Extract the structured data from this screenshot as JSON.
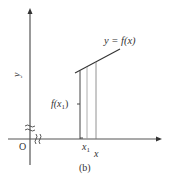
{
  "figure": {
    "caption": "(b)",
    "axes": {
      "x_label": "x",
      "y_label": "y",
      "origin_label": "O",
      "x_break_symbol": "§",
      "y_break_symbol": "≈"
    },
    "curve": {
      "label": "y = f(x)"
    },
    "point": {
      "x_label": "x1",
      "x_label_main": "x",
      "x_label_sub": "1",
      "y_label": "f(x1)",
      "y_label_prefix": "f(x",
      "y_label_sub": "1",
      "y_label_suffix": ")"
    },
    "colors": {
      "axis": "#555555",
      "line": "#333333",
      "thin": "#999999"
    }
  }
}
